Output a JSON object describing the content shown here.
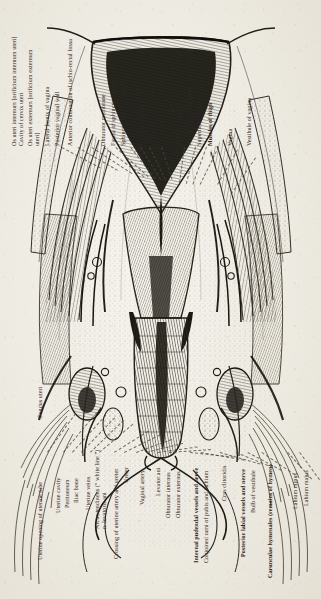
{
  "plate": {
    "title": "Coronal section through the female pelvis — uterus, vagina and perineum",
    "orientation": "rotated-90-ccw",
    "paper_color": "#efece4",
    "ink_color": "#2a2722"
  },
  "labels_top": [
    {
      "id": "os-uteri-internum",
      "text": "Os uteri internum [orificium internum uteri]",
      "line2": "Cavity of cervix uteri",
      "bold": false
    },
    {
      "id": "os-uteri-externum",
      "text": "Os uteri externum [orificium externum",
      "line2": "uteri]",
      "bold": false
    },
    {
      "id": "lateral-fornix-of-vagina",
      "text": "Lateral fornix of vagina",
      "line2": "",
      "bold": false
    },
    {
      "id": "posterior-vaginal-wall",
      "text": "Posterior vaginal wall",
      "line2": "",
      "bold": false
    },
    {
      "id": "anterior-continuation-ischio-rectal-fossa",
      "text": "Anterior continuation of ischio-rectal fossa",
      "line2": "",
      "bold": false
    },
    {
      "id": "obturator-membrane",
      "text": "Obturator membrane",
      "line2": "",
      "bold": false
    },
    {
      "id": "fascia-of-sphincter-urethrae",
      "text": "Fascia of sphincter urethrae",
      "line2": "",
      "bold": false
    },
    {
      "id": "sphincter-urethrae-muscle",
      "text": "Sphincter urethrae muscle",
      "line2": "",
      "bold": false
    },
    {
      "id": "perineal-membrane",
      "text": "Perineal membrane",
      "line2": "",
      "bold": false
    },
    {
      "id": "ischio-cavernosus",
      "text": "Ischio-cavernosus",
      "line2": "",
      "bold": false
    },
    {
      "id": "bulbo-spongiosus",
      "text": "Bulbo-spongiosus [bulbo-cavernosus]",
      "line2": "",
      "bold": false
    },
    {
      "id": "superficial-aponeurosis",
      "text": "Superficial aponeurosis",
      "line2": "",
      "bold": false
    },
    {
      "id": "muscles-of-thigh",
      "text": "Muscles of thigh",
      "line2": "",
      "bold": false
    },
    {
      "id": "vagina",
      "text": "Vagina",
      "line2": "",
      "bold": false
    },
    {
      "id": "vestibule-of-vagina",
      "text": "Vestibule of vagina",
      "line2": "",
      "bold": false
    }
  ],
  "labels_bottom": [
    {
      "id": "fundus-uteri",
      "text": "Fundus uteri",
      "line2": "",
      "bold": false
    },
    {
      "id": "uterine-opening-of-uterine-tube",
      "text": "Uterine opening of uterine tube",
      "line2": "",
      "bold": false
    },
    {
      "id": "uterine-cavity",
      "text": "Uterine cavity",
      "line2": "",
      "bold": false
    },
    {
      "id": "peritoneum",
      "text": "Peritoneum",
      "line2": "",
      "bold": false
    },
    {
      "id": "iliac-bone",
      "text": "Iliac bone",
      "line2": "",
      "bold": false
    },
    {
      "id": "uterine-veins",
      "text": "Uterine veins",
      "line2": "",
      "bold": false
    },
    {
      "id": "arcus-tendineus",
      "text": "Arcus tendineus (“ white line ”)",
      "line2": "n. levatoris ani",
      "bold": false
    },
    {
      "id": "crossing-of-uterine-artery-and-ureter",
      "text": "Crossing of uterine artery and ureter",
      "line2": "",
      "bold": false
    },
    {
      "id": "ureter",
      "text": "Ureter",
      "line2": "",
      "bold": false
    },
    {
      "id": "vaginal-artery",
      "text": "Vaginal artery",
      "line2": "",
      "bold": false
    },
    {
      "id": "levator-ani",
      "text": "Levator ani",
      "line2": "",
      "bold": false
    },
    {
      "id": "obturator-internus",
      "text": "Obturator internus",
      "line2": "",
      "bold": false
    },
    {
      "id": "obturator-externus",
      "text": "Obturator externus",
      "line2": "",
      "bold": false
    },
    {
      "id": "internal-pudendal-vessels-and-nerve",
      "text": "Internal pudendal vessels and nerve",
      "line2": "",
      "bold": true
    },
    {
      "id": "conjoined-rami-of-pubis-and-ischium",
      "text": "Conjoined rami of pubis and ischium",
      "line2": "",
      "bold": false
    },
    {
      "id": "crus-clitoridis",
      "text": "Crus clitoridis",
      "line2": "",
      "bold": false
    },
    {
      "id": "posterior-labial-vessels-and-nerve",
      "text": "Posterior labial vessels and nerve",
      "line2": "",
      "bold": true
    },
    {
      "id": "bulb-of-vestibule",
      "text": "Bulb of vestibule",
      "line2": "",
      "bold": false
    },
    {
      "id": "carunculae-hymenales",
      "text": "Carunculae hymenales (remains of hymen)",
      "line2": "",
      "bold": true
    },
    {
      "id": "labium-minus",
      "text": "Labium minus",
      "line2": "",
      "bold": false
    },
    {
      "id": "labium-majus",
      "text": "Labium majus",
      "line2": "",
      "bold": false
    }
  ]
}
